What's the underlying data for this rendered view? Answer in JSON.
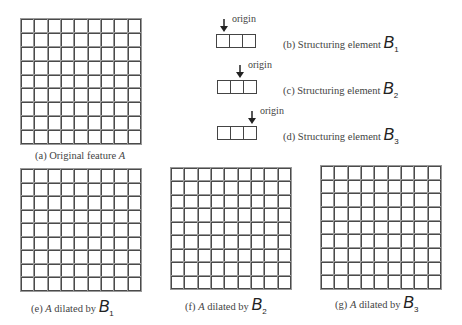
{
  "figure": {
    "grid_rows": 9,
    "grid_cols": 9,
    "panels": [
      {
        "id": "a",
        "caption_prefix": "(a)  Original feature ",
        "caption_italic": "A",
        "caption_symbol": "",
        "caption_sub": ""
      },
      {
        "id": "e",
        "caption_prefix": "(e) ",
        "caption_italic": "A",
        "caption_suffix": " dilated by ",
        "caption_symbol": "B",
        "caption_sub": "1"
      },
      {
        "id": "f",
        "caption_prefix": "(f) ",
        "caption_italic": "A",
        "caption_suffix": " dilated by ",
        "caption_symbol": "B",
        "caption_sub": "2"
      },
      {
        "id": "g",
        "caption_prefix": "(g) ",
        "caption_italic": "A",
        "caption_suffix": " dilated by ",
        "caption_symbol": "B",
        "caption_sub": "3"
      }
    ],
    "structuring_elements": [
      {
        "id": "b",
        "label": "(b)  Structuring element ",
        "symbol": "B",
        "sub": "1",
        "origin_label": "origin",
        "origin_cell": 1,
        "cells": 3
      },
      {
        "id": "c",
        "label": "(c)  Structuring element ",
        "symbol": "B",
        "sub": "2",
        "origin_label": "origin",
        "origin_cell": 2,
        "cells": 3
      },
      {
        "id": "d",
        "label": "(d)  Structuring element ",
        "symbol": "B",
        "sub": "3",
        "origin_label": "origin",
        "origin_cell": 3,
        "cells": 3
      }
    ]
  }
}
